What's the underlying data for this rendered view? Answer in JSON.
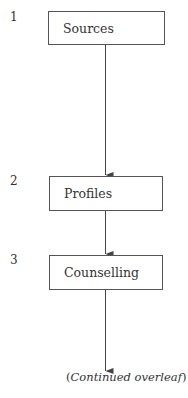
{
  "steps": [
    {
      "number": "1",
      "label": "Sources"
    },
    {
      "number": "2",
      "label": "Profiles"
    },
    {
      "number": "3",
      "label": "Counselling"
    }
  ],
  "footer": {
    "open": "(",
    "text": "Continued overleaf",
    "close": ")"
  }
}
